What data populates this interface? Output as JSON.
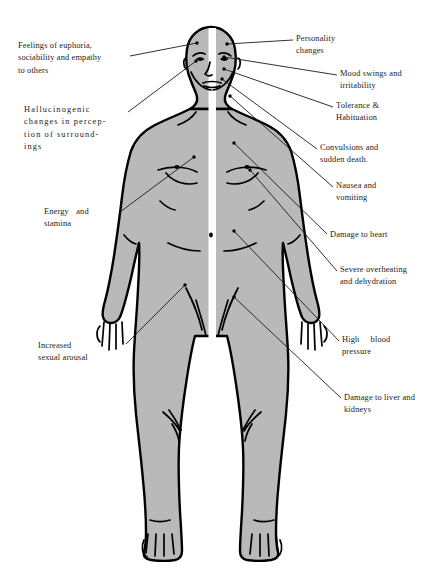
{
  "figure": {
    "title_present": false,
    "fill_color": "#b9b9b9",
    "outline_color": "#000000",
    "stripe_color": "#ffffff",
    "background": "#ffffff"
  },
  "labels": {
    "left": [
      {
        "id": "euphoria",
        "text": "Feelings of euphoria,\nsociability and empathy\nto others",
        "x": 18,
        "y": 40,
        "width": 108,
        "anchor_x": 200,
        "anchor_y": 44,
        "leader": [
          [
            130,
            56
          ],
          [
            197,
            43
          ]
        ]
      },
      {
        "id": "hallucinogenic",
        "text": "Hallucinogenic\nchanges in percep-\ntion of surround-\nings",
        "x": 24,
        "y": 104,
        "width": 100,
        "anchor_x": 197,
        "anchor_y": 62,
        "leader": [
          [
            128,
            112
          ],
          [
            196,
            61
          ]
        ]
      },
      {
        "id": "energy",
        "text": "Energy   and\nstamina",
        "x": 44,
        "y": 206,
        "width": 74,
        "anchor_x": 196,
        "anchor_y": 157,
        "leader": [
          [
            120,
            212
          ],
          [
            194,
            157
          ]
        ]
      },
      {
        "id": "sexual-arousal",
        "text": "Increased\nsexual arousal",
        "x": 38,
        "y": 340,
        "width": 86,
        "anchor_x": 186,
        "anchor_y": 284,
        "leader": [
          [
            126,
            344
          ],
          [
            185,
            285
          ]
        ]
      }
    ],
    "right": [
      {
        "id": "personality",
        "text": "Personality\nchanges",
        "x": 296,
        "y": 33,
        "width": 96,
        "anchor_x": 225,
        "anchor_y": 45,
        "leader": [
          [
            293,
            40
          ],
          [
            227,
            44
          ]
        ]
      },
      {
        "id": "mood-swings",
        "text": "Mood swings and\nirritability",
        "x": 340,
        "y": 68,
        "width": 100,
        "anchor_x": 222,
        "anchor_y": 57,
        "leader": [
          [
            337,
            75
          ],
          [
            224,
            57
          ]
        ]
      },
      {
        "id": "tolerance",
        "text": "Tolerance &\nHabituation",
        "x": 336,
        "y": 100,
        "width": 98,
        "anchor_x": 222,
        "anchor_y": 69,
        "leader": [
          [
            333,
            107
          ],
          [
            224,
            69
          ]
        ]
      },
      {
        "id": "convulsions",
        "text": "Convulsions and\nsudden death.",
        "x": 320,
        "y": 142,
        "width": 106,
        "anchor_x": 220,
        "anchor_y": 79,
        "leader": [
          [
            317,
            149
          ],
          [
            222,
            79
          ]
        ]
      },
      {
        "id": "nausea",
        "text": "Nausea and\nvomiting",
        "x": 336,
        "y": 180,
        "width": 92,
        "anchor_x": 228,
        "anchor_y": 96,
        "leader": [
          [
            333,
            187
          ],
          [
            230,
            96
          ]
        ]
      },
      {
        "id": "damage-heart",
        "text": "Damage to heart",
        "x": 330,
        "y": 229,
        "width": 104,
        "anchor_x": 232,
        "anchor_y": 143,
        "leader": [
          [
            327,
            234
          ],
          [
            234,
            143
          ]
        ]
      },
      {
        "id": "overheating",
        "text": "Severe overheating\nand dehydration",
        "x": 340,
        "y": 264,
        "width": 104,
        "anchor_x": 248,
        "anchor_y": 170,
        "leader": [
          [
            337,
            271
          ],
          [
            250,
            170
          ]
        ]
      },
      {
        "id": "high-blood-pressure",
        "text": "High    blood\npressure",
        "x": 342,
        "y": 334,
        "width": 94,
        "anchor_x": 232,
        "anchor_y": 230,
        "leader": [
          [
            339,
            341
          ],
          [
            234,
            231
          ]
        ]
      },
      {
        "id": "damage-liver",
        "text": "Damage to liver and\nkidneys",
        "x": 344,
        "y": 392,
        "width": 100,
        "anchor_x": 232,
        "anchor_y": 296,
        "leader": [
          [
            341,
            398
          ],
          [
            234,
            297
          ]
        ]
      }
    ]
  }
}
